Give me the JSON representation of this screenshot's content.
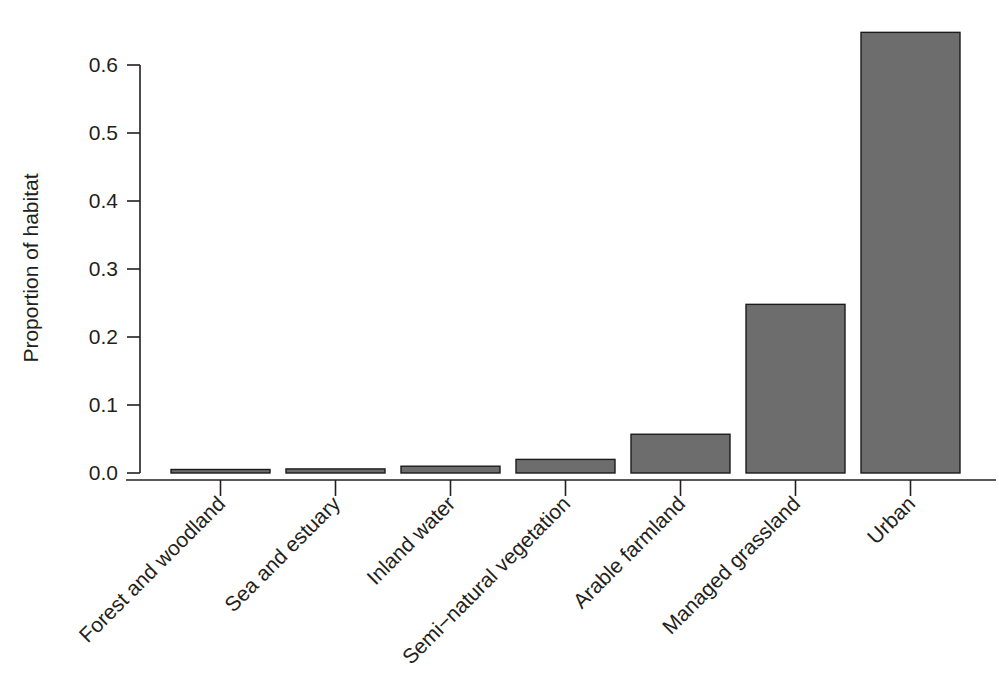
{
  "chart_data": {
    "type": "bar",
    "title": "",
    "xlabel": "",
    "ylabel": "Proportion of  habitat",
    "categories": [
      "Forest and woodland",
      "Sea and estuary",
      "Inland water",
      "Semi−natural vegetation",
      "Arable farmland",
      "Managed grassland",
      "Urban"
    ],
    "values": [
      0.004,
      0.006,
      0.01,
      0.02,
      0.057,
      0.248,
      0.648
    ],
    "ylim": [
      0.0,
      0.65
    ],
    "yticks": [
      0.0,
      0.1,
      0.2,
      0.3,
      0.4,
      0.5,
      0.6
    ],
    "ytick_labels": [
      "0.0",
      "0.1",
      "0.2",
      "0.3",
      "0.4",
      "0.5",
      "0.6"
    ],
    "grid": false,
    "legend": "none",
    "bar_color": "#6d6d6d",
    "bar_edge_color": "#1c1c1c",
    "axis_color": "#231f20",
    "background_color": "#ffffff",
    "xtick_label_rotation": -45
  }
}
